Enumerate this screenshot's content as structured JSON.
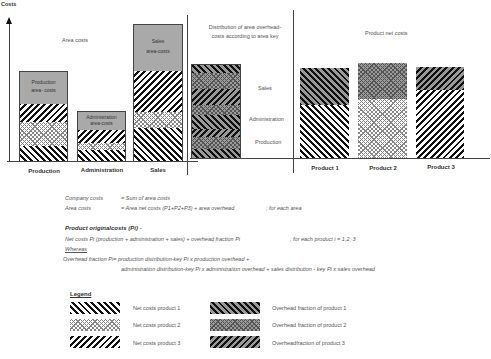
{
  "axis": {
    "y_label": "Costs"
  },
  "panels": {
    "area_costs": {
      "title": "Area costs",
      "bars": [
        {
          "label": "Production",
          "box_label_1": "Production",
          "box_label_2": "area- costs"
        },
        {
          "label": "Administration",
          "box_label_1": "Administration",
          "box_label_2": "area-costs"
        },
        {
          "label": "Sales",
          "box_label_1": "Sales",
          "box_label_2": "area-costs"
        }
      ]
    },
    "distribution": {
      "title_1": "Distribution of area overhead-",
      "title_2": "costs according to area key",
      "labels": {
        "sales": "Sales",
        "administration": "Administration",
        "production": "Production"
      }
    },
    "product_net": {
      "title": "Product net costs",
      "bars": [
        {
          "label": "Product 1"
        },
        {
          "label": "Product 2"
        },
        {
          "label": "Product 3"
        }
      ]
    }
  },
  "formulas": {
    "company_costs_label": "Company costs",
    "company_costs_value": "= Sum of area costs",
    "area_costs_label": "Area costs",
    "area_costs_value": "= Area net costs (P1+P2+P3) + area overhead",
    "area_costs_note": "; for each area",
    "product_heading": "Product originalcosts (Pi) -",
    "net_costs_line": "Net costs Pi (production + administration + sales) + overhead fraction Pi",
    "net_costs_note": "; for  each product i = 1,2, 3",
    "whereas": "Whereas",
    "overhead_line_1": "Overhead fraction Pi=    production distribution-key Pi  x  production overhead +",
    "overhead_line_2": "administration distribution-key Pi  x  administration overhead + sales distribution - key Pi  x  sales overhead"
  },
  "legend": {
    "title": "Legend",
    "items": [
      {
        "label": "Net costs product 1"
      },
      {
        "label": "Net costs product 2"
      },
      {
        "label": "Net costs product 3"
      },
      {
        "label": "Overhead fraction of product 1"
      },
      {
        "label": "Overhead fraction of product 2"
      },
      {
        "label": "Overheadfraction of product 3"
      }
    ]
  }
}
